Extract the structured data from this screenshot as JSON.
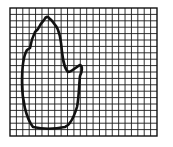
{
  "figure": {
    "grid": {
      "x": 10,
      "y": 8,
      "width": 147,
      "height": 128,
      "cols": 23,
      "rows": 20,
      "line_color": "#1a1a1a",
      "border_color": "#111111"
    },
    "outline": {
      "stroke": "#111111",
      "stroke_width": 2.6,
      "shape": "hand-silhouette"
    }
  }
}
